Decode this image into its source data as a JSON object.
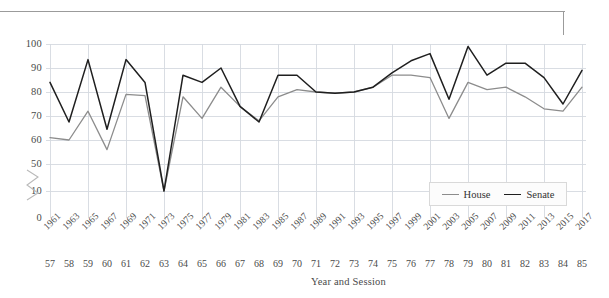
{
  "chart_data": {
    "type": "line",
    "title": "",
    "xlabel": "Year and Session",
    "ylabel": "",
    "ylim": [
      0,
      100
    ],
    "yticks": [
      0,
      10,
      50,
      60,
      70,
      80,
      90,
      100
    ],
    "axis_break": {
      "between": [
        10,
        50
      ],
      "marker": "zigzag"
    },
    "grid": true,
    "grid_axis": "both",
    "legend_position": "bottom-right",
    "categories": [
      "1961",
      "1963",
      "1965",
      "1967",
      "1969",
      "1971",
      "1973",
      "1975",
      "1977",
      "1979",
      "1981",
      "1983",
      "1985",
      "1987",
      "1989",
      "1991",
      "1993",
      "1995",
      "1997",
      "1999",
      "2001",
      "2003",
      "2005",
      "2007",
      "2009",
      "2011",
      "2013",
      "2015",
      "2017"
    ],
    "sessions": [
      "57",
      "58",
      "59",
      "60",
      "61",
      "62",
      "63",
      "64",
      "65",
      "66",
      "67",
      "68",
      "69",
      "70",
      "71",
      "72",
      "73",
      "74",
      "75",
      "76",
      "77",
      "78",
      "79",
      "80",
      "81",
      "82",
      "83",
      "84",
      "85"
    ],
    "series": [
      {
        "name": "House",
        "color": "#8c8c8c",
        "values": [
          61,
          60,
          72,
          56,
          79,
          78.5,
          48,
          78,
          69,
          82,
          74,
          68,
          78,
          81,
          80,
          79.5,
          80,
          82,
          87,
          87,
          86,
          69,
          84,
          81,
          82,
          78,
          73,
          72,
          82
        ]
      },
      {
        "name": "Senate",
        "color": "#1f1f1f",
        "values": [
          84,
          67.5,
          93.5,
          64.5,
          93.5,
          84,
          48,
          87,
          84,
          90,
          74,
          67.5,
          87,
          87,
          80,
          79.5,
          80,
          82,
          88,
          93,
          96,
          77,
          99,
          87,
          92,
          92,
          86,
          75,
          89
        ]
      }
    ]
  },
  "legend": {
    "items": [
      {
        "label": "House"
      },
      {
        "label": "Senate"
      }
    ]
  }
}
